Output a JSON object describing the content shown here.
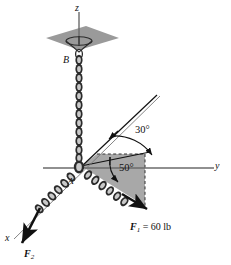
{
  "figure": {
    "type": "statics-free-body-diagram"
  },
  "axes": {
    "x_label": "x",
    "y_label": "y",
    "z_label": "z"
  },
  "points": {
    "a_label": "A",
    "b_label": "B"
  },
  "angles": {
    "upper": "30°",
    "lower": "50°"
  },
  "forces": {
    "f1_label": "F",
    "f1_sub": "1",
    "f1_value": "= 60 lb",
    "f1_full": "F₁ = 60 lb",
    "f2_label": "F",
    "f2_sub": "2",
    "f2_full": "F₂"
  },
  "colors": {
    "shade_fill": "#a8a8a8",
    "plate_fill": "#9a9a9a",
    "line": "#1a1a1a",
    "axis": "#6b6b6b",
    "chain_dark": "#2b2b2b",
    "chain_light": "#b5b5b5"
  }
}
